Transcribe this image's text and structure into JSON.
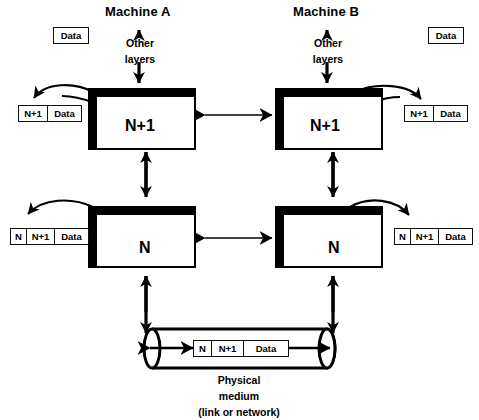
{
  "diagram": {
    "colors": {
      "ink": "#000000",
      "background": "#ffffff"
    },
    "machines": [
      {
        "id": "a",
        "label": "Machine A"
      },
      {
        "id": "b",
        "label": "Machine B"
      }
    ],
    "other_layers": {
      "line1": "Other",
      "line2": "layers"
    },
    "layers": {
      "upper": {
        "name": "N+1"
      },
      "lower": {
        "name": "N"
      }
    },
    "data_boxes": {
      "top_left": {
        "segments": [
          "Data"
        ]
      },
      "top_right": {
        "segments": [
          "Data"
        ]
      }
    },
    "packets": {
      "upper_left": {
        "segments": [
          "N+1",
          "Data"
        ]
      },
      "upper_right": {
        "segments": [
          "N+1",
          "Data"
        ]
      },
      "lower_left": {
        "segments": [
          "N",
          "N+1",
          "Data"
        ]
      },
      "lower_right": {
        "segments": [
          "N",
          "N+1",
          "Data"
        ]
      },
      "medium": {
        "segments": [
          "N",
          "N+1",
          "Data"
        ]
      }
    },
    "medium": {
      "line1": "Physical",
      "line2": "medium",
      "line3": "(link or network)"
    }
  }
}
